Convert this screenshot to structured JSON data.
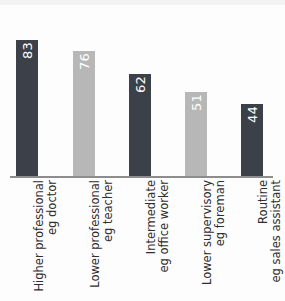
{
  "chart_data": {
    "type": "bar",
    "title": "",
    "subtitle": "",
    "xlabel": "",
    "ylabel": "",
    "ylim": [
      0,
      100
    ],
    "grid": false,
    "legend": "none",
    "orientation": "vertical-bars-rotated-labels",
    "categories": [
      "Higher professional eg doctor",
      "Lower professional eg teacher",
      "Intermediate eg office worker",
      "Lower supervisory eg foreman",
      "Routine eg sales assistant"
    ],
    "category_lines": [
      [
        "Higher professional",
        "eg doctor"
      ],
      [
        "Lower professional",
        "eg teacher"
      ],
      [
        "Intermediate",
        "eg office worker"
      ],
      [
        "Lower supervisory",
        "eg foreman"
      ],
      [
        "Routine",
        "eg sales assistant"
      ]
    ],
    "values": [
      83,
      76,
      62,
      51,
      44
    ],
    "value_labels": [
      "83",
      "76",
      "62",
      "51",
      "44"
    ],
    "bar_colors": [
      "#3b4049",
      "#b7b7b7",
      "#3b4049",
      "#b7b7b7",
      "#3b4049"
    ],
    "value_label_colors": [
      "#ffffff",
      "#ffffff",
      "#ffffff",
      "#ffffff",
      "#ffffff"
    ]
  },
  "colors": {
    "dark_bar": "#3b4049",
    "light_bar": "#b7b7b7",
    "axis": "#8d8d8d",
    "label_text": "#2e2e2e",
    "background": "#fdfdfd"
  }
}
